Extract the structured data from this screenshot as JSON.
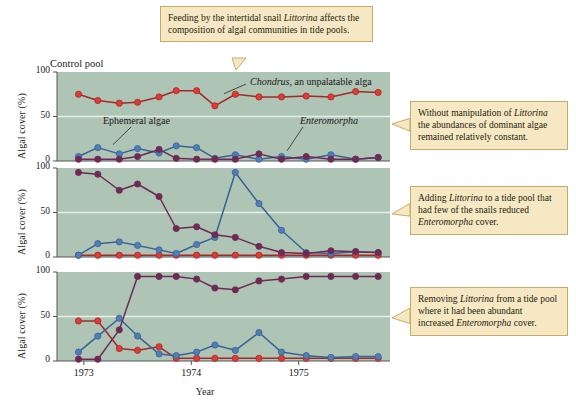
{
  "caption_top": {
    "lines": [
      {
        "t": "Feeding by the intertidal"
      },
      {
        "t": "snail "
      },
      {
        "t": "Littorina",
        "i": true
      },
      {
        "t": " affects the"
      },
      {
        "t": "composition of algal"
      },
      {
        "t": "communities in tide pools."
      }
    ],
    "text": "Feeding by the intertidal snail Littorina affects the composition of algal communities in tide pools."
  },
  "callouts": [
    {
      "id": "callout-1",
      "text": "Without manipulation of Littorina the abundances of dominant algae remained relatively constant."
    },
    {
      "id": "callout-2",
      "text": "Adding Littorina to a tide pool that had few of the snails reduced Enteromorpha cover."
    },
    {
      "id": "callout-3",
      "text": "Removing Littorina from a tide pool where it had been abundant increased Enteromorpha cover."
    }
  ],
  "axes": {
    "ylabel": "Algal cover (%)",
    "yticks": [
      "0",
      "50",
      "100"
    ],
    "xlabel": "Year",
    "xticks": [
      "1973",
      "1974",
      "1975"
    ],
    "ylim": [
      0,
      100
    ],
    "xlim": [
      1972.75,
      1975.85
    ]
  },
  "panel_labels": {
    "control_pool": "Control pool",
    "chondrus": "Chondrus, an unpalatable alga",
    "ephemeral": "Ephemeral algae",
    "enteromorpha": "Enteromorpha"
  },
  "colors": {
    "plot_background": "#aec4b5",
    "callout_fill": "#f6e8c3",
    "callout_border": "#c9ab68",
    "chondrus_marker": "#e03b35",
    "chondrus_line": "#a32a28",
    "ephemeral_marker": "#4f7fb8",
    "ephemeral_line": "#3b6296",
    "enteromorpha_marker": "#6e2a55",
    "enteromorpha_line": "#6e2a55",
    "gridline": "#e8eee9",
    "axis": "#555555"
  },
  "chart_data": {
    "type": "line",
    "title": "Feeding by the intertidal snail Littorina affects the composition of algal communities in tide pools.",
    "xlabel": "Year",
    "ylabel": "Algal cover (%)",
    "ylim": [
      0,
      100
    ],
    "xlim": [
      1972.75,
      1975.85
    ],
    "yticks": [
      0,
      50,
      100
    ],
    "xticks": [
      1973,
      1974,
      1975
    ],
    "grid": true,
    "legend": "inline-annotations",
    "panels": [
      {
        "name": "Control pool",
        "annotation": "Without manipulation of Littorina the abundances of dominant algae remained relatively constant.",
        "series": [
          {
            "name": "Chondrus",
            "color": "#e03b35",
            "x": [
              1972.95,
              1973.13,
              1973.33,
              1973.5,
              1973.7,
              1973.86,
              1974.05,
              1974.22,
              1974.41,
              1974.63,
              1974.84,
              1975.07,
              1975.3,
              1975.53,
              1975.74
            ],
            "values": [
              75,
              68,
              65,
              66,
              72,
              79,
              79,
              62,
              75,
              72,
              72,
              73,
              72,
              78,
              77
            ]
          },
          {
            "name": "Ephemeral algae",
            "color": "#4f7fb8",
            "x": [
              1972.95,
              1973.13,
              1973.33,
              1973.5,
              1973.7,
              1973.86,
              1974.05,
              1974.22,
              1974.41,
              1974.63,
              1974.84,
              1975.07,
              1975.3,
              1975.53,
              1975.74
            ],
            "values": [
              5,
              15,
              8,
              14,
              9,
              17,
              15,
              3,
              7,
              2,
              5,
              2,
              7,
              2,
              4
            ]
          },
          {
            "name": "Enteromorpha",
            "color": "#6e2a55",
            "x": [
              1972.95,
              1973.13,
              1973.33,
              1973.5,
              1973.7,
              1973.86,
              1974.05,
              1974.22,
              1974.41,
              1974.63,
              1974.84,
              1975.07,
              1975.3,
              1975.53,
              1975.74
            ],
            "values": [
              2,
              2,
              2,
              5,
              13,
              3,
              2,
              2,
              2,
              8,
              2,
              5,
              2,
              2,
              4
            ]
          }
        ]
      },
      {
        "name": "Littorina added",
        "annotation": "Adding Littorina to a tide pool that had few of the snails reduced Enteromorpha cover.",
        "series": [
          {
            "name": "Chondrus",
            "color": "#e03b35",
            "x": [
              1972.95,
              1973.13,
              1973.33,
              1973.5,
              1973.7,
              1973.86,
              1974.05,
              1974.22,
              1974.41,
              1974.63,
              1974.84,
              1975.07,
              1975.3,
              1975.53,
              1975.74
            ],
            "values": [
              2,
              2,
              2,
              2,
              2,
              2,
              2,
              2,
              2,
              2,
              2,
              2,
              2,
              2,
              2
            ]
          },
          {
            "name": "Ephemeral algae",
            "color": "#4f7fb8",
            "x": [
              1972.95,
              1973.13,
              1973.33,
              1973.5,
              1973.7,
              1973.86,
              1974.05,
              1974.22,
              1974.41,
              1974.63,
              1974.84,
              1975.07,
              1975.3,
              1975.53,
              1975.74
            ],
            "values": [
              2,
              15,
              17,
              13,
              8,
              4,
              14,
              22,
              95,
              60,
              30,
              5,
              4,
              6,
              5
            ]
          },
          {
            "name": "Enteromorpha",
            "color": "#6e2a55",
            "x": [
              1972.95,
              1973.13,
              1973.33,
              1973.5,
              1973.7,
              1973.86,
              1974.05,
              1974.22,
              1974.41,
              1974.63,
              1974.84,
              1975.07,
              1975.3,
              1975.53,
              1975.74
            ],
            "values": [
              95,
              93,
              75,
              82,
              68,
              32,
              34,
              25,
              22,
              12,
              5,
              4,
              7,
              6,
              5
            ]
          }
        ]
      },
      {
        "name": "Littorina removed",
        "annotation": "Removing Littorina from a tide pool where it had been abundant increased Enteromorpha cover.",
        "series": [
          {
            "name": "Chondrus",
            "color": "#e03b35",
            "x": [
              1972.95,
              1973.13,
              1973.33,
              1973.5,
              1973.7,
              1973.86,
              1974.05,
              1974.22,
              1974.41,
              1974.63,
              1974.84,
              1975.07,
              1975.3,
              1975.53,
              1975.74
            ],
            "values": [
              45,
              45,
              14,
              12,
              16,
              3,
              3,
              3,
              3,
              3,
              3,
              3,
              3,
              3,
              3
            ]
          },
          {
            "name": "Ephemeral algae",
            "color": "#4f7fb8",
            "x": [
              1972.95,
              1973.13,
              1973.33,
              1973.5,
              1973.7,
              1973.86,
              1974.05,
              1974.22,
              1974.41,
              1974.63,
              1974.84,
              1975.07,
              1975.3,
              1975.53,
              1975.74
            ],
            "values": [
              10,
              28,
              48,
              28,
              8,
              6,
              10,
              18,
              12,
              32,
              10,
              6,
              4,
              5,
              5
            ]
          },
          {
            "name": "Enteromorpha",
            "color": "#6e2a55",
            "x": [
              1972.95,
              1973.13,
              1973.33,
              1973.5,
              1973.7,
              1973.86,
              1974.05,
              1974.22,
              1974.41,
              1974.63,
              1974.84,
              1975.07,
              1975.3,
              1975.53,
              1975.74
            ],
            "values": [
              2,
              2,
              35,
              95,
              95,
              95,
              92,
              82,
              80,
              90,
              92,
              95,
              95,
              95,
              95
            ]
          }
        ]
      }
    ]
  }
}
